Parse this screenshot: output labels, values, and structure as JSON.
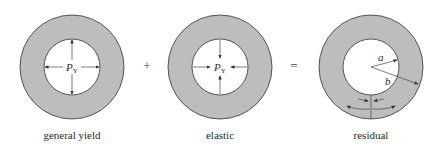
{
  "figure": {
    "panels": [
      {
        "id": "general-yield",
        "caption": "general yield",
        "pressure_label": "P",
        "pressure_subscript": "Y",
        "arrow_direction": "outward"
      },
      {
        "id": "elastic",
        "caption": "elastic",
        "pressure_label": "P",
        "pressure_subscript": "Y",
        "arrow_direction": "inward"
      },
      {
        "id": "residual",
        "caption": "residual",
        "radius_inner_label": "a",
        "radius_outer_label": "b"
      }
    ],
    "operators": [
      "+",
      "="
    ],
    "colors": {
      "ring_fill": "#bdbdbd",
      "stroke": "#333333",
      "background": "#ffffff"
    }
  }
}
